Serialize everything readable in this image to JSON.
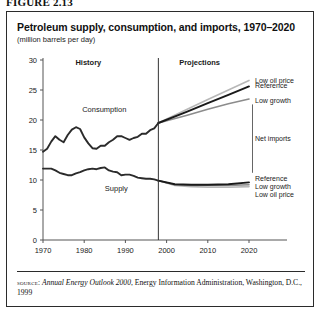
{
  "figure": {
    "caption": "FIGURE 2.13"
  },
  "chart_data": {
    "type": "line",
    "title": "Petroleum supply, consumption, and imports, 1970–2020",
    "subtitle": "(million barrels per day)",
    "xlabel": "",
    "ylabel": "",
    "ylim": [
      0,
      30
    ],
    "xlim": [
      1970,
      2020
    ],
    "ytick_labels": [
      "0",
      "5",
      "10",
      "15",
      "20",
      "25",
      "30"
    ],
    "yticks": [
      0,
      5,
      10,
      15,
      20,
      25,
      30
    ],
    "xtick_labels": [
      "1970",
      "1980",
      "1990",
      "2000",
      "2010",
      "2020"
    ],
    "xticks": [
      1970,
      1980,
      1990,
      2000,
      2010,
      2020
    ],
    "grid": false,
    "legend_position": "right-inline",
    "divider_year": 1998,
    "annotations": [
      {
        "text": "History",
        "kind": "section",
        "x": 1981
      },
      {
        "text": "Projections",
        "kind": "section",
        "x": 2008
      },
      {
        "text": "Consumption",
        "kind": "series",
        "x": 1984
      },
      {
        "text": "Supply",
        "kind": "series",
        "x": 1987
      },
      {
        "text": "Net imports",
        "kind": "bracket",
        "x": 2021
      }
    ],
    "series": [
      {
        "name": "Consumption",
        "segment": "history",
        "x": [
          1970,
          1971,
          1972,
          1973,
          1974,
          1975,
          1976,
          1977,
          1978,
          1979,
          1980,
          1981,
          1982,
          1983,
          1984,
          1985,
          1986,
          1987,
          1988,
          1989,
          1990,
          1991,
          1992,
          1993,
          1994,
          1995,
          1996,
          1997,
          1998
        ],
        "values": [
          14.7,
          15.2,
          16.4,
          17.3,
          16.7,
          16.3,
          17.5,
          18.4,
          18.8,
          18.5,
          17.1,
          16.1,
          15.3,
          15.2,
          15.7,
          15.7,
          16.3,
          16.7,
          17.3,
          17.3,
          17.0,
          16.7,
          17.0,
          17.2,
          17.7,
          17.7,
          18.3,
          18.6,
          19.5
        ]
      },
      {
        "name": "Supply",
        "segment": "history",
        "x": [
          1970,
          1971,
          1972,
          1973,
          1974,
          1975,
          1976,
          1977,
          1978,
          1979,
          1980,
          1981,
          1982,
          1983,
          1984,
          1985,
          1986,
          1987,
          1988,
          1989,
          1990,
          1991,
          1992,
          1993,
          1994,
          1995,
          1996,
          1997,
          1998
        ],
        "values": [
          11.9,
          11.9,
          11.9,
          11.6,
          11.2,
          11.0,
          10.8,
          10.8,
          11.1,
          11.3,
          11.6,
          11.8,
          11.9,
          11.8,
          12.0,
          12.1,
          11.6,
          11.4,
          11.3,
          10.8,
          10.9,
          10.9,
          10.7,
          10.4,
          10.3,
          10.2,
          10.2,
          10.1,
          9.9
        ]
      },
      {
        "name": "Low oil price",
        "segment": "projection",
        "group": "consumption",
        "x": [
          1998,
          2005,
          2010,
          2015,
          2020
        ],
        "values": [
          19.5,
          21.8,
          23.4,
          25.0,
          26.6
        ]
      },
      {
        "name": "Reference",
        "segment": "projection",
        "group": "consumption",
        "x": [
          1998,
          2005,
          2010,
          2015,
          2020
        ],
        "values": [
          19.5,
          21.4,
          22.8,
          24.2,
          25.6
        ]
      },
      {
        "name": "Low growth",
        "segment": "projection",
        "group": "consumption",
        "x": [
          1998,
          2005,
          2010,
          2015,
          2020
        ],
        "values": [
          19.5,
          20.8,
          21.8,
          22.7,
          23.5
        ]
      },
      {
        "name": "Reference",
        "segment": "projection",
        "group": "supply",
        "x": [
          1998,
          2002,
          2006,
          2010,
          2015,
          2020
        ],
        "values": [
          9.9,
          9.3,
          9.2,
          9.2,
          9.3,
          9.6
        ]
      },
      {
        "name": "Low growth",
        "segment": "projection",
        "group": "supply",
        "x": [
          1998,
          2002,
          2006,
          2010,
          2015,
          2020
        ],
        "values": [
          9.9,
          9.2,
          9.1,
          9.1,
          9.1,
          9.2
        ]
      },
      {
        "name": "Low oil price",
        "segment": "projection",
        "group": "supply",
        "x": [
          1998,
          2002,
          2006,
          2010,
          2015,
          2020
        ],
        "values": [
          9.9,
          9.1,
          8.9,
          8.8,
          8.8,
          8.9
        ]
      }
    ],
    "fan_labels_upper": [
      "Low oil price",
      "Reference",
      "Low growth"
    ],
    "fan_labels_lower": [
      "Reference",
      "Low growth",
      "Low oil price"
    ],
    "colors": {
      "reference": "#1a1a1a",
      "low_growth": "#8c8c8c",
      "low_oil_price": "#b8b8b8",
      "history": "#2b2b2b",
      "axis": "#555555",
      "divider": "#333333",
      "frame": "#2b2b2b"
    }
  },
  "source": {
    "label": "source:",
    "publication": "Annual Energy Outlook 2000",
    "rest": ", Energy Information Administration, Washington, D.C., 1999"
  }
}
